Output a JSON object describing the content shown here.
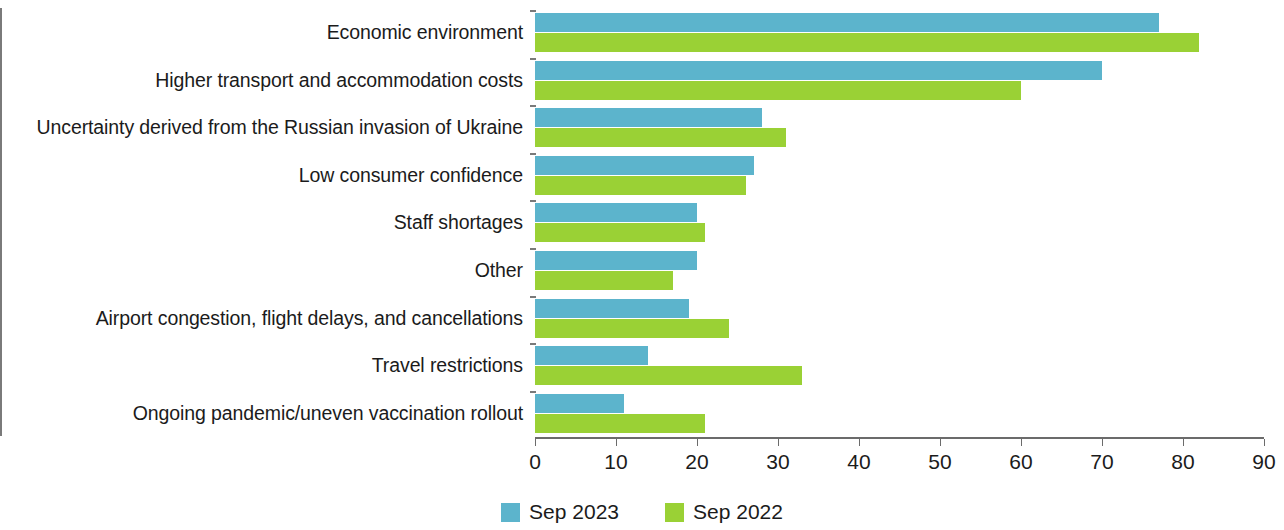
{
  "chart_data": {
    "type": "bar",
    "orientation": "horizontal",
    "title": "",
    "subtitle": "",
    "xlabel": "",
    "ylabel": "",
    "xlim": [
      0,
      90
    ],
    "xticks": [
      0,
      10,
      20,
      30,
      40,
      50,
      60,
      70,
      80,
      90
    ],
    "grid": false,
    "legend_position": "bottom-center",
    "categories": [
      "Economic environment",
      "Higher transport and accommodation costs",
      "Uncertainty derived from the Russian invasion of Ukraine",
      "Low consumer confidence",
      "Staff shortages",
      "Other",
      "Airport congestion, flight delays, and cancellations",
      "Travel restrictions",
      "Ongoing pandemic/uneven vaccination rollout"
    ],
    "series": [
      {
        "name": "Sep 2023",
        "color": "#5cb4cc",
        "values": [
          77,
          70,
          28,
          27,
          20,
          20,
          19,
          14,
          11
        ]
      },
      {
        "name": "Sep 2022",
        "color": "#9ad135",
        "values": [
          82,
          60,
          31,
          26,
          21,
          17,
          24,
          33,
          21
        ]
      }
    ]
  },
  "legend": {
    "items": [
      {
        "label": "Sep 2023",
        "color": "#5cb4cc"
      },
      {
        "label": "Sep 2022",
        "color": "#9ad135"
      }
    ]
  }
}
